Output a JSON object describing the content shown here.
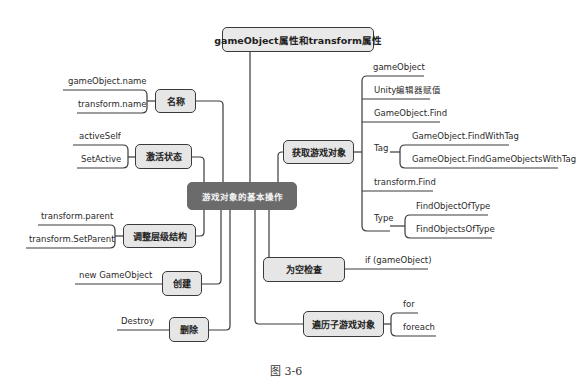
{
  "root": {
    "label": "gameObject属性和transform属性"
  },
  "center": {
    "label": "游戏对象的基本操作"
  },
  "branches": {
    "name": {
      "label": "名称",
      "leaves": [
        "gameObject.name",
        "transform.name"
      ]
    },
    "active": {
      "label": "激活状态",
      "leaves": [
        "activeSelf",
        "SetActive"
      ]
    },
    "hierarchy": {
      "label": "调整层级结构",
      "leaves": [
        "transform.parent",
        "transform.SetParent"
      ]
    },
    "create": {
      "label": "创建",
      "leaves": [
        "new GameObject"
      ]
    },
    "delete": {
      "label": "删除",
      "leaves": [
        "Destroy"
      ]
    },
    "get": {
      "label": "获取游戏对象",
      "leaves": [
        "gameObject",
        "Unity编辑器赋值",
        "GameObject.Find",
        "Tag",
        "transform.Find",
        "Type"
      ],
      "tag_children": [
        "GameObject.FindWithTag",
        "GameObject.FindGameObjectsWithTag"
      ],
      "type_children": [
        "FindObjectOfType",
        "FindObjectsOfType"
      ]
    },
    "nullcheck": {
      "label": "为空检查",
      "leaves": [
        "if (gameObject)"
      ]
    },
    "traverse": {
      "label": "遍历子游戏对象",
      "leaves": [
        "for",
        "foreach"
      ]
    }
  },
  "caption": "图 3-6",
  "colors": {
    "center_fill": "#6b6b6b",
    "node_fill": "#e6e6e6",
    "line": "#3a3a3a"
  }
}
